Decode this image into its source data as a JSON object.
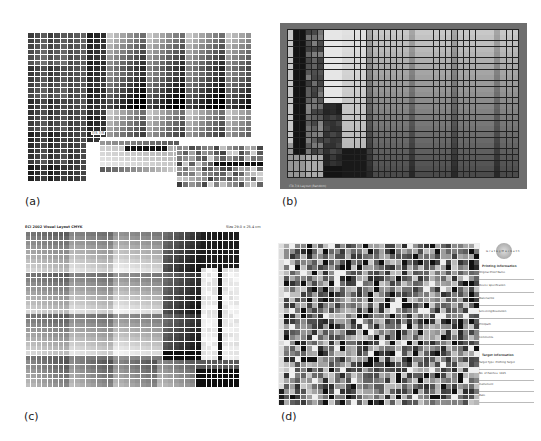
{
  "panels": [
    {
      "id": "a",
      "label": "(a)",
      "inset_title": "ITS 7/8"
    },
    {
      "id": "b",
      "label": "(b)",
      "footer_text": "IT8.7/4 Layout (Random)"
    },
    {
      "id": "c",
      "label": "(c)",
      "header_left": "ECI 2002 Visual Layout CMYK",
      "header_right": "Size 29.0 x 25.4 cm"
    },
    {
      "id": "d",
      "label": "(d)",
      "logo_text": "GretagMacbeth",
      "sidebar_heading_1": "Printing Information",
      "sidebar_fields_1": [
        "Original Proof Name",
        "Device Specification",
        "Material/Ink",
        "Screening/Resolution",
        "Printpath",
        "Comments"
      ],
      "sidebar_heading_2": "Target Information",
      "sidebar_fields_2": [
        "Target Type: Profiling Target",
        "No. of Patches: 1485",
        "Instrument",
        "Date"
      ]
    }
  ],
  "colors": {
    "frame_b": "#6e6e6e",
    "grid_line_light": "#ffffff",
    "grid_line_dark": "#222222"
  }
}
